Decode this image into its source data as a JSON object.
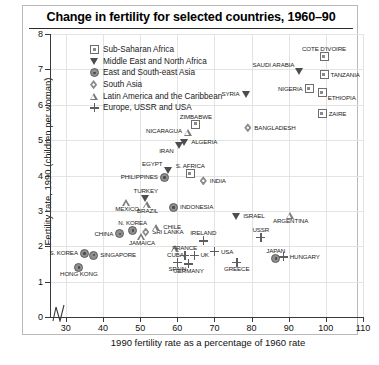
{
  "chart": {
    "title": "Change in fertility for selected countries, 1960–90",
    "xlabel": "1990 fertility rate as a percentage of 1960 rate",
    "ylabel": "Fertility rate, 1990 (children per woman)",
    "xticks": [
      "30",
      "40",
      "50",
      "60",
      "70",
      "80",
      "90",
      "100",
      "110"
    ],
    "yticks": [
      "0",
      "1",
      "2",
      "3",
      "4",
      "5",
      "6",
      "7",
      "8"
    ]
  },
  "legend": [
    {
      "label": "Sub-Saharan Africa",
      "marker": "square"
    },
    {
      "label": "Middle East and North Africa",
      "marker": "tri-down"
    },
    {
      "label": "East and South-east Asia",
      "marker": "circle"
    },
    {
      "label": "South Asia",
      "marker": "diamond"
    },
    {
      "label": "Latin America and the Caribbean",
      "marker": "tri-up"
    },
    {
      "label": "Europe, USSR and USA",
      "marker": "plus"
    }
  ],
  "chart_data": {
    "type": "scatter",
    "title": "Change in fertility for selected countries, 1960–90",
    "xlabel": "1990 fertility rate as a percentage of 1960 rate",
    "ylabel": "Fertility rate, 1990 (children per woman)",
    "xlim": [
      26,
      110
    ],
    "ylim": [
      0,
      8
    ],
    "grid": true,
    "legend_position": "top-left inside plot",
    "note": "x axis has a break between 0 and 30",
    "series": [
      {
        "name": "Sub-Saharan Africa",
        "marker": "square",
        "points": [
          {
            "label": "COTE D'IVOIRE",
            "x": 99.5,
            "y": 7.35,
            "lpos": "above"
          },
          {
            "label": "TANZANIA",
            "x": 99.5,
            "y": 6.85,
            "lpos": "right"
          },
          {
            "label": "ETHIOPIA",
            "x": 99.0,
            "y": 6.35,
            "lpos": "belowright"
          },
          {
            "label": "NIGERIA",
            "x": 95.5,
            "y": 6.45,
            "lpos": "left"
          },
          {
            "label": "ZAIRE",
            "x": 99.0,
            "y": 5.75,
            "lpos": "right"
          },
          {
            "label": "ZIMBABWE",
            "x": 65.0,
            "y": 5.45,
            "lpos": "above"
          },
          {
            "label": "S. AFRICA",
            "x": 63.5,
            "y": 4.05,
            "lpos": "above"
          }
        ]
      },
      {
        "name": "Middle East and North Africa",
        "marker": "tri-down",
        "points": [
          {
            "label": "SAUDI ARABIA",
            "x": 93.0,
            "y": 6.95,
            "lpos": "leftabove"
          },
          {
            "label": "SYRIA",
            "x": 78.5,
            "y": 6.3,
            "lpos": "left"
          },
          {
            "label": "ALGERIA",
            "x": 62.0,
            "y": 4.95,
            "lpos": "right"
          },
          {
            "label": "IRAN",
            "x": 60.5,
            "y": 4.85,
            "lpos": "belowleft"
          },
          {
            "label": "EGYPT",
            "x": 57.5,
            "y": 4.15,
            "lpos": "leftabove"
          },
          {
            "label": "TURKEY",
            "x": 51.5,
            "y": 3.35,
            "lpos": "above"
          },
          {
            "label": "ISRAEL",
            "x": 76.0,
            "y": 2.85,
            "lpos": "right"
          }
        ]
      },
      {
        "name": "East and South-east Asia",
        "marker": "circle",
        "points": [
          {
            "label": "PHILIPPINES",
            "x": 56.5,
            "y": 3.95,
            "lpos": "left"
          },
          {
            "label": "INDONESIA",
            "x": 59.0,
            "y": 3.1,
            "lpos": "right"
          },
          {
            "label": "N. KOREA",
            "x": 48.0,
            "y": 2.45,
            "lpos": "above"
          },
          {
            "label": "CHINA",
            "x": 44.5,
            "y": 2.35,
            "lpos": "left"
          },
          {
            "label": "S. KOREA",
            "x": 35.0,
            "y": 1.8,
            "lpos": "left"
          },
          {
            "label": "SINGAPORE",
            "x": 37.5,
            "y": 1.75,
            "lpos": "right"
          },
          {
            "label": "HONG KONG",
            "x": 33.5,
            "y": 1.4,
            "lpos": "below"
          },
          {
            "label": "JAPAN",
            "x": 86.5,
            "y": 1.65,
            "lpos": "above"
          }
        ]
      },
      {
        "name": "South Asia",
        "marker": "diamond",
        "points": [
          {
            "label": "BANGLADESH",
            "x": 79.0,
            "y": 5.35,
            "lpos": "right"
          },
          {
            "label": "INDIA",
            "x": 67.0,
            "y": 3.85,
            "lpos": "right"
          },
          {
            "label": "SRI LANKA",
            "x": 51.5,
            "y": 2.4,
            "lpos": "right"
          }
        ]
      },
      {
        "name": "Latin America and the Caribbean",
        "marker": "tri-up",
        "points": [
          {
            "label": "NICARAGUA",
            "x": 63.0,
            "y": 5.25,
            "lpos": "left"
          },
          {
            "label": "MEXICO",
            "x": 46.5,
            "y": 3.25,
            "lpos": "below"
          },
          {
            "label": "BRAZIL",
            "x": 52.0,
            "y": 3.2,
            "lpos": "below"
          },
          {
            "label": "CHILE",
            "x": 54.5,
            "y": 2.55,
            "lpos": "right"
          },
          {
            "label": "JAMAICA",
            "x": 50.5,
            "y": 2.3,
            "lpos": "below"
          },
          {
            "label": "CUBA",
            "x": 59.5,
            "y": 1.95,
            "lpos": "below"
          },
          {
            "label": "ARGENTINA",
            "x": 90.5,
            "y": 2.9,
            "lpos": "below"
          }
        ]
      },
      {
        "name": "Europe, USSR and USA",
        "marker": "plus",
        "points": [
          {
            "label": "USSR",
            "x": 82.5,
            "y": 2.25,
            "lpos": "above"
          },
          {
            "label": "HUNGARY",
            "x": 88.5,
            "y": 1.7,
            "lpos": "right"
          },
          {
            "label": "IRELAND",
            "x": 67.0,
            "y": 2.15,
            "lpos": "above"
          },
          {
            "label": "USA",
            "x": 70.0,
            "y": 1.85,
            "lpos": "right"
          },
          {
            "label": "FRANCE",
            "x": 62.0,
            "y": 1.75,
            "lpos": "above"
          },
          {
            "label": "UK",
            "x": 64.5,
            "y": 1.75,
            "lpos": "right"
          },
          {
            "label": "SPAIN",
            "x": 60.0,
            "y": 1.55,
            "lpos": "below"
          },
          {
            "label": "GERMANY",
            "x": 63.0,
            "y": 1.5,
            "lpos": "below"
          },
          {
            "label": "GREECE",
            "x": 76.0,
            "y": 1.55,
            "lpos": "below"
          }
        ]
      }
    ]
  }
}
